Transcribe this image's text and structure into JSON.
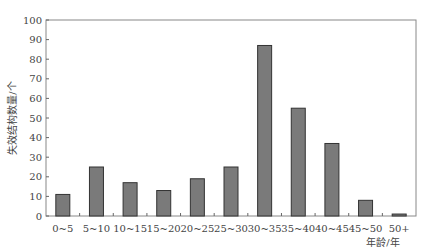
{
  "chart_data": {
    "type": "bar",
    "title": "",
    "xlabel": "年龄/年",
    "ylabel": "失效结构数量/个",
    "categories": [
      "0~5",
      "5~10",
      "10~15",
      "15~20",
      "20~25",
      "25~30",
      "30~35",
      "35~40",
      "40~45",
      "45~50",
      "50+"
    ],
    "values": [
      11,
      25,
      17,
      13,
      19,
      25,
      87,
      55,
      37,
      8,
      1
    ],
    "ylim": [
      0,
      100
    ],
    "yticks": [
      0,
      10,
      20,
      30,
      40,
      50,
      60,
      70,
      80,
      90,
      100
    ],
    "grid": false,
    "legend": null,
    "bar_color": "#7a7a7a",
    "bar_edge_color": "#333333"
  }
}
